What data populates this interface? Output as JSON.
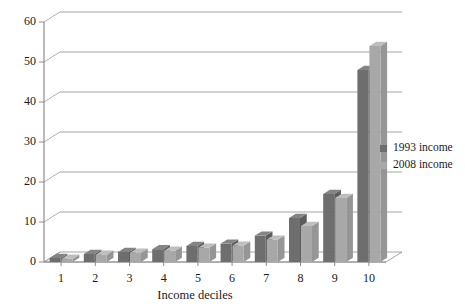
{
  "chart_data": {
    "type": "bar",
    "title": "",
    "subtitle": "",
    "xlabel": "Income deciles",
    "ylabel": "",
    "categories": [
      "1",
      "2",
      "3",
      "4",
      "5",
      "6",
      "7",
      "8",
      "9",
      "10"
    ],
    "series": [
      {
        "name": "1993 income",
        "color": "#6e6e6e",
        "values": [
          1,
          2,
          2.5,
          3.2,
          4,
          4.6,
          6.6,
          11,
          17,
          48
        ]
      },
      {
        "name": "2008 income",
        "color": "#a8a8a8",
        "values": [
          0.8,
          1.8,
          2.3,
          2.8,
          3.6,
          4.1,
          5.6,
          9,
          16,
          54
        ]
      }
    ],
    "ylim": [
      0,
      60
    ],
    "yticks": [
      0,
      10,
      20,
      30,
      40,
      50,
      60
    ],
    "ytick_labels": [
      "0",
      "10",
      "20",
      "30",
      "40",
      "50",
      "60"
    ],
    "grid": true,
    "grid_axis": "y",
    "legend_position": "right",
    "style": "3d-bar",
    "plot_background": "#ffffff"
  },
  "legend": {
    "items": [
      {
        "label": "1993 income",
        "color": "#6e6e6e"
      },
      {
        "label": "2008 income",
        "color": "#a8a8a8"
      }
    ]
  },
  "colors": {
    "series_1993": "#6e6e6e",
    "series_2008": "#a8a8a8",
    "axis": "#8c8c8c",
    "grid": "#9a9a9a",
    "text": "#1a1a1a",
    "background": "#ffffff"
  }
}
